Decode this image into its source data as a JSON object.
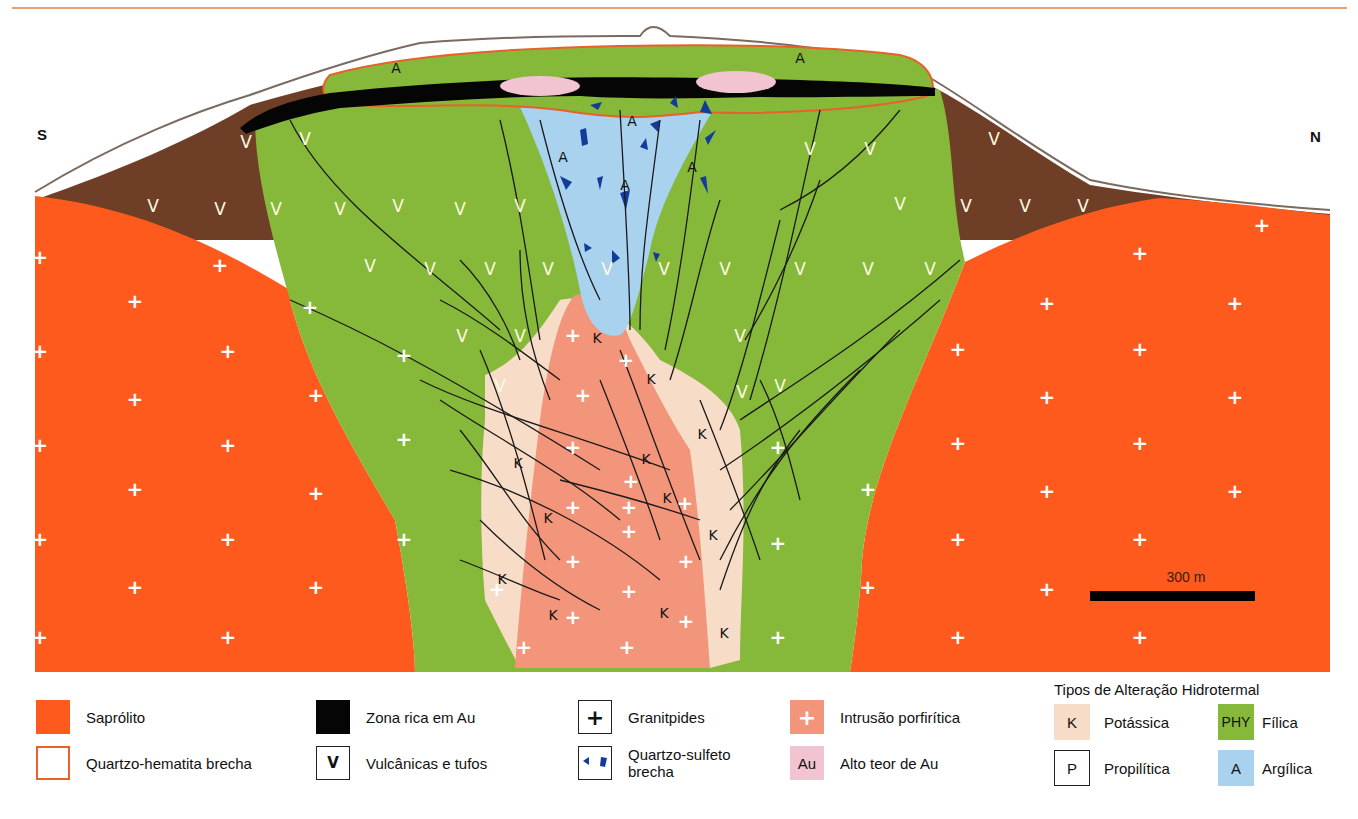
{
  "figure": {
    "compass": {
      "south": "S",
      "north": "N"
    },
    "scale_bar": {
      "label": "300 m"
    },
    "zone_labels": {
      "argillic": "A",
      "potassic": "K",
      "volcanic": "V",
      "granitoid": "+"
    },
    "colors": {
      "saprolite": "#ff5a1e",
      "volcanic_brown": "#6e3f26",
      "phyllic_green": "#86b93a",
      "argillic_blue": "#a9d2ee",
      "potassic_beige": "#f7dcc8",
      "porphyry_salmon": "#f2957a",
      "high_grade_au_pink": "#f2c3d0",
      "au_rich_black": "#050505",
      "qz_hematite_outline": "#e8612a",
      "qz_sulfide_blue": "#123b9a"
    }
  },
  "legend": {
    "items": [
      {
        "key": "saprolite",
        "label": "Saprólito",
        "symbol": ""
      },
      {
        "key": "qz_hematite",
        "label": "Quartzo-hematita brecha",
        "symbol": ""
      },
      {
        "key": "au_rich",
        "label": "Zona rica em Au",
        "symbol": ""
      },
      {
        "key": "volcanics",
        "label": "Vulcânicas e tufos",
        "symbol": "V"
      },
      {
        "key": "granitoids",
        "label": "Granitpides",
        "symbol": "+"
      },
      {
        "key": "qz_sulfide",
        "label": "Quartzo-sulfeto brecha",
        "label_line1": "Quartzo-sulfeto",
        "label_line2": "brecha",
        "symbol": ""
      },
      {
        "key": "porphyry",
        "label": "Intrusão porfirítica",
        "symbol": "+"
      },
      {
        "key": "high_grade_au",
        "label": "Alto teor de Au",
        "symbol": "Au"
      }
    ],
    "alteration": {
      "title": "Tipos de Alteração Hidrotermal",
      "items": [
        {
          "key": "potassic",
          "label": "Potássica",
          "symbol": "K"
        },
        {
          "key": "phyllic",
          "label": "Fílica",
          "symbol": "PHY"
        },
        {
          "key": "propylitic",
          "label": "Propilítica",
          "symbol": "P"
        },
        {
          "key": "argillic",
          "label": "Argílica",
          "symbol": "A"
        }
      ]
    }
  }
}
